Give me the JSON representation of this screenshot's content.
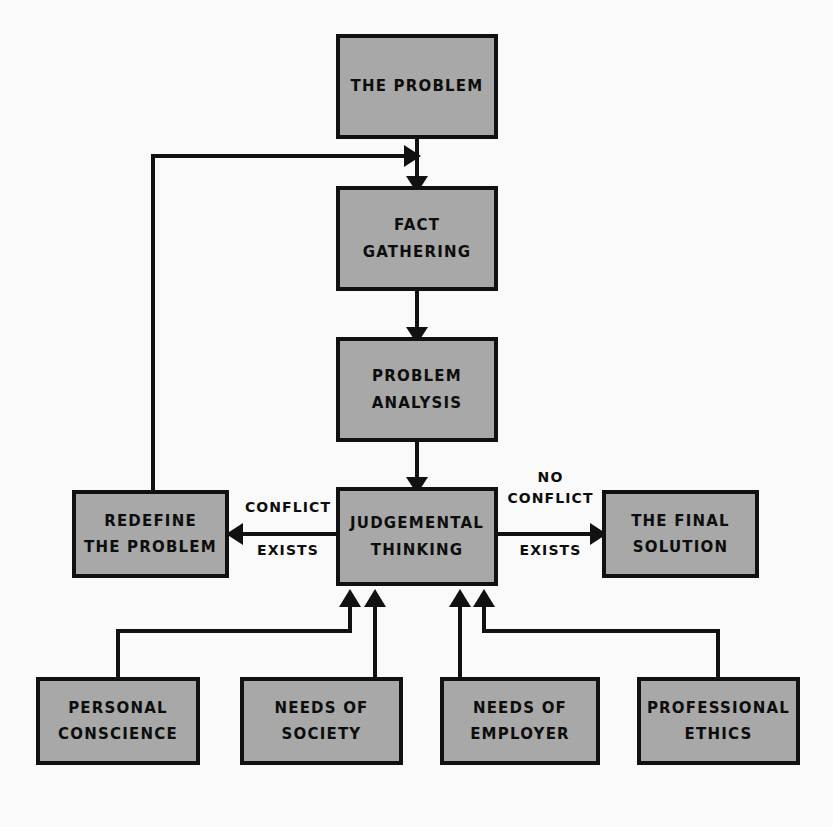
{
  "diagram": {
    "type": "flowchart",
    "background_color": "#fafafa",
    "node_fill_color": "#a8a8a8",
    "node_border_color": "#111111",
    "text_color": "#0d0d0d",
    "nodes": [
      {
        "id": "the-problem",
        "label": "THE PROBLEM",
        "x": 336,
        "y": 34,
        "w": 162,
        "h": 105
      },
      {
        "id": "fact-gathering",
        "label": "FACT GATHERING",
        "x": 336,
        "y": 186,
        "w": 162,
        "h": 105
      },
      {
        "id": "problem-analysis",
        "label": "PROBLEM\nANALYSIS",
        "x": 336,
        "y": 337,
        "w": 162,
        "h": 105
      },
      {
        "id": "judgemental-thinking",
        "label": "JUDGEMENTAL\nTHINKING",
        "x": 336,
        "y": 487,
        "w": 162,
        "h": 99
      },
      {
        "id": "redefine-the-problem",
        "label": "REDEFINE\nTHE PROBLEM",
        "x": 72,
        "y": 490,
        "w": 157,
        "h": 88
      },
      {
        "id": "the-final-solution",
        "label": "THE FINAL\nSOLUTION",
        "x": 602,
        "y": 490,
        "w": 157,
        "h": 88
      },
      {
        "id": "personal-conscience",
        "label": "PERSONAL\nCONSCIENCE",
        "x": 36,
        "y": 677,
        "w": 164,
        "h": 88
      },
      {
        "id": "needs-of-society",
        "label": "NEEDS OF\nSOCIETY",
        "x": 240,
        "y": 677,
        "w": 163,
        "h": 88
      },
      {
        "id": "needs-of-employer",
        "label": "NEEDS OF\nEMPLOYER",
        "x": 440,
        "y": 677,
        "w": 160,
        "h": 88
      },
      {
        "id": "professional-ethics",
        "label": "PROFESSIONAL\nETHICS",
        "x": 637,
        "y": 677,
        "w": 163,
        "h": 88
      }
    ],
    "edge_labels": [
      {
        "id": "conflict-exists",
        "text": "CONFLICT",
        "x": 243,
        "y": 497,
        "w": 90
      },
      {
        "id": "conflict-exists-2",
        "text": "EXISTS",
        "x": 243,
        "y": 537,
        "w": 90
      },
      {
        "id": "no-conflict",
        "text": "NO\nCONFLICT",
        "x": 503,
        "y": 467,
        "w": 95
      },
      {
        "id": "no-conflict-exists",
        "text": "EXISTS",
        "x": 503,
        "y": 537,
        "w": 95
      }
    ],
    "edges": [
      {
        "id": "problem-to-fact",
        "from": "the-problem",
        "to": "fact-gathering",
        "kind": "straight-down"
      },
      {
        "id": "fact-to-analysis",
        "from": "fact-gathering",
        "to": "problem-analysis",
        "kind": "straight-down"
      },
      {
        "id": "analysis-to-judgement",
        "from": "problem-analysis",
        "to": "judgemental-thinking",
        "kind": "straight-down"
      },
      {
        "id": "judgement-to-redefine",
        "from": "judgemental-thinking",
        "to": "redefine-the-problem",
        "kind": "straight-left",
        "label": "CONFLICT EXISTS"
      },
      {
        "id": "judgement-to-final-solution",
        "from": "judgemental-thinking",
        "to": "the-final-solution",
        "kind": "straight-right",
        "label": "NO CONFLICT EXISTS"
      },
      {
        "id": "redefine-feedback-loop",
        "from": "redefine-the-problem",
        "to": "fact-gathering",
        "kind": "loop-left-up"
      },
      {
        "id": "conscience-to-judgement",
        "from": "personal-conscience",
        "to": "judgemental-thinking",
        "kind": "elbow-up-right"
      },
      {
        "id": "society-to-judgement",
        "from": "needs-of-society",
        "to": "judgemental-thinking",
        "kind": "straight-up"
      },
      {
        "id": "employer-to-judgement",
        "from": "needs-of-employer",
        "to": "judgemental-thinking",
        "kind": "straight-up"
      },
      {
        "id": "ethics-to-judgement",
        "from": "professional-ethics",
        "to": "judgemental-thinking",
        "kind": "elbow-up-left"
      }
    ]
  }
}
